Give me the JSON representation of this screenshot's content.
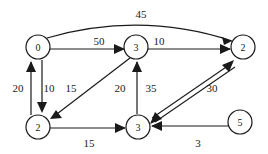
{
  "figure": {
    "background_color": "#ffffff",
    "stroke_color": "#1a1a1a",
    "width": 268,
    "height": 154
  },
  "nodes": [
    {
      "id": "n0",
      "label": "0",
      "x": 38,
      "y": 47,
      "r": 12
    },
    {
      "id": "n1",
      "label": "3",
      "x": 136,
      "y": 47,
      "r": 12
    },
    {
      "id": "n2",
      "label": "2",
      "x": 243,
      "y": 47,
      "r": 12
    },
    {
      "id": "n3",
      "label": "2",
      "x": 38,
      "y": 127,
      "r": 12
    },
    {
      "id": "n4",
      "label": "3",
      "x": 138,
      "y": 127,
      "r": 12
    },
    {
      "id": "n5",
      "label": "5",
      "x": 240,
      "y": 122,
      "r": 12
    }
  ],
  "edges": [
    {
      "id": "e-45",
      "from": "n0",
      "to": "n2",
      "weight": "45",
      "shape": "curve",
      "label_x": 141,
      "label_y": 14
    },
    {
      "id": "e-50",
      "from": "n0",
      "to": "n1",
      "weight": "50",
      "shape": "straight",
      "label_x": 99,
      "label_y": 41
    },
    {
      "id": "e-10top",
      "from": "n1",
      "to": "n2",
      "weight": "10",
      "shape": "straight",
      "label_x": 159,
      "label_y": 41
    },
    {
      "id": "e-20up",
      "from": "n3",
      "to": "n0",
      "weight": "20",
      "shape": "vertical",
      "label_x": 18,
      "label_y": 88
    },
    {
      "id": "e-10down",
      "from": "n0",
      "to": "n3",
      "weight": "10",
      "shape": "vertical",
      "label_x": 49,
      "label_y": 88
    },
    {
      "id": "e-15diag",
      "from": "n1",
      "to": "n3",
      "weight": "15",
      "shape": "diagonal",
      "label_x": 71,
      "label_y": 88
    },
    {
      "id": "e-20diag",
      "from": "n1",
      "to": "n3",
      "weight": "20",
      "shape": "label-only",
      "label_x": 120,
      "label_y": 88
    },
    {
      "id": "e-35",
      "from": "n4",
      "to": "n1",
      "weight": "35",
      "shape": "vertical",
      "label_x": 151,
      "label_y": 88
    },
    {
      "id": "e-30",
      "from": "n4",
      "to": "n2",
      "weight": "30",
      "shape": "double-diagonal",
      "label_x": 212,
      "label_y": 88
    },
    {
      "id": "e-15bot",
      "from": "n3",
      "to": "n4",
      "weight": "15",
      "shape": "straight",
      "label_x": 89,
      "label_y": 143
    },
    {
      "id": "e-3",
      "from": "n5",
      "to": "n4",
      "weight": "3",
      "shape": "straight",
      "label_x": 198,
      "label_y": 143
    }
  ]
}
